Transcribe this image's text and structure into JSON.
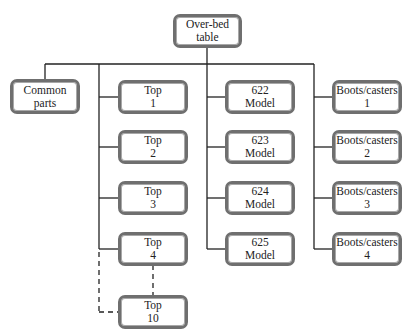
{
  "diagram": {
    "type": "tree",
    "root": {
      "line1": "Over-bed",
      "line2": "table"
    },
    "common": {
      "line1": "Common",
      "line2": "parts"
    },
    "tops": [
      {
        "line1": "Top",
        "line2": "1"
      },
      {
        "line1": "Top",
        "line2": "2"
      },
      {
        "line1": "Top",
        "line2": "3"
      },
      {
        "line1": "Top",
        "line2": "4"
      },
      {
        "line1": "Top",
        "line2": "10"
      }
    ],
    "models": [
      {
        "line1": "622",
        "line2": "Model"
      },
      {
        "line1": "623",
        "line2": "Model"
      },
      {
        "line1": "624",
        "line2": "Model"
      },
      {
        "line1": "625",
        "line2": "Model"
      }
    ],
    "boots": [
      {
        "line1": "Boots/casters",
        "line2": "1"
      },
      {
        "line1": "Boots/casters",
        "line2": "2"
      },
      {
        "line1": "Boots/casters",
        "line2": "3"
      },
      {
        "line1": "Boots/casters",
        "line2": "4"
      }
    ],
    "colors": {
      "line": "#222222",
      "box_border": "#6f6f6f"
    }
  }
}
